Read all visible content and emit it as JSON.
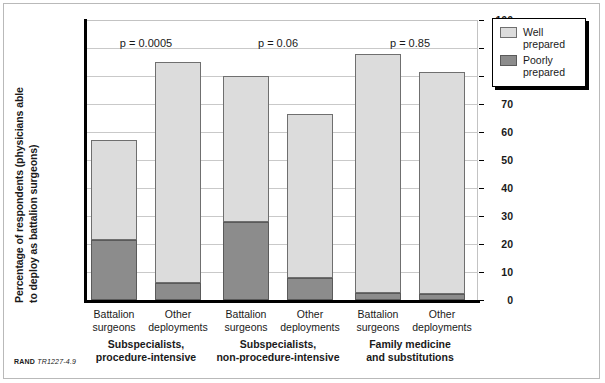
{
  "chart_data": {
    "type": "bar",
    "subtype": "stacked-bar",
    "title": "",
    "xlabel": "",
    "ylabel": "Percentage of respondents (physicians able to deploy as battalion surgeons)",
    "ylabel_line1": "Percentage of respondents (physicians able",
    "ylabel_line2": "to deploy as battalion surgeons)",
    "ylim": [
      0,
      100
    ],
    "ytick_step": 10,
    "yticks": [
      "0",
      "10",
      "20",
      "30",
      "40",
      "50",
      "60",
      "70",
      "80",
      "90",
      "100"
    ],
    "grid": true,
    "legend_position": "right-outside",
    "categories": [
      "Battalion surgeons",
      "Other deployments",
      "Battalion surgeons",
      "Other deployments",
      "Battalion surgeons",
      "Other deployments"
    ],
    "series": [
      {
        "name": "Well prepared",
        "color": "#dcdcdc",
        "values": [
          35.5,
          79,
          52,
          58.5,
          85.5,
          79.5
        ]
      },
      {
        "name": "Poorly prepared",
        "color": "#8c8c8c",
        "values": [
          21.5,
          6,
          28,
          8,
          2.5,
          2
        ]
      }
    ],
    "totals": [
      57,
      85,
      80,
      66.5,
      88,
      81.5
    ],
    "annotations": [
      {
        "text": "p = 0.0005",
        "group": "Subspecialists, procedure-intensive"
      },
      {
        "text": "p = 0.06",
        "group": "Subspecialists, non-procedure-intensive"
      },
      {
        "text": "p = 0.85",
        "group": "Family medicine and substitutions"
      }
    ],
    "groups": [
      {
        "line1": "Subspecialists,",
        "line2": "procedure-intensive"
      },
      {
        "line1": "Subspecialists,",
        "line2": "non-procedure-intensive"
      },
      {
        "line1": "Family medicine",
        "line2": "and substitutions"
      }
    ]
  },
  "legend": {
    "items": [
      {
        "label": "Well\nprepared",
        "color": "#dcdcdc"
      },
      {
        "label": "Poorly\nprepared",
        "color": "#8c8c8c"
      }
    ]
  },
  "bars": [
    {
      "tick_line1": "Battalion",
      "tick_line2": "surgeons",
      "poor": 21.5,
      "total": 57
    },
    {
      "tick_line1": "Other",
      "tick_line2": "deployments",
      "poor": 6,
      "total": 85
    },
    {
      "tick_line1": "Battalion",
      "tick_line2": "surgeons",
      "poor": 28,
      "total": 80
    },
    {
      "tick_line1": "Other",
      "tick_line2": "deployments",
      "poor": 8,
      "total": 66.5
    },
    {
      "tick_line1": "Battalion",
      "tick_line2": "surgeons",
      "poor": 2.5,
      "total": 88
    },
    {
      "tick_line1": "Other",
      "tick_line2": "deployments",
      "poor": 2,
      "total": 81.5
    }
  ],
  "footer": {
    "publisher": "RAND",
    "document_id": "TR1227-4.9"
  }
}
